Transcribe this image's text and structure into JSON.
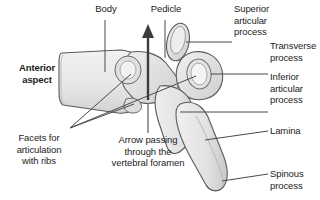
{
  "figure": {
    "background_color": "#ffffff",
    "bone_fill": "#e9e9e9",
    "bone_fill_dark": "#d6d6d6",
    "outline_color": "#555555",
    "leader_color": "#4a4a4a",
    "text_color": "#1d1d1d"
  },
  "labels": {
    "body": "Body",
    "pedicle": "Pedicle",
    "superior_articular_process": "Superior\narticular\nprocess",
    "transverse_process": "Transverse\nprocess",
    "inferior_articular_process": "Inferior\narticular\nprocess",
    "lamina": "Lamina",
    "spinous_process": "Spinous\nprocess",
    "anterior_aspect": "Anterior\naspect",
    "facets_for_articulation": "Facets for\narticulation\nwith ribs",
    "arrow_note": "Arrow passing\nthrough the\nvertebral foramen"
  }
}
